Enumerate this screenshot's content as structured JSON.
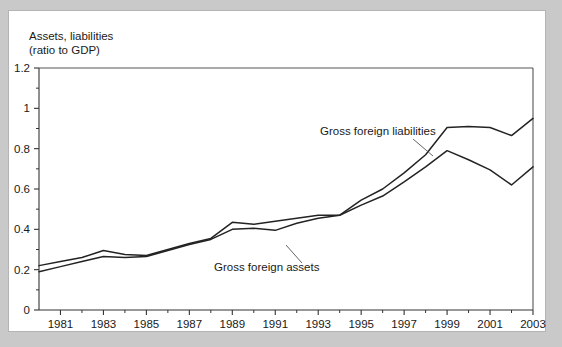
{
  "figure": {
    "axis_title_line1": "Assets, liabilities",
    "axis_title_line2": "(ratio to GDP)",
    "background_color": "#c9c9c9",
    "panel_color": "#ffffff",
    "line_color": "#232323"
  },
  "chart_data": {
    "type": "line",
    "title": "Assets, liabilities (ratio to GDP)",
    "xlabel": "",
    "ylabel": "Assets, liabilities (ratio to GDP)",
    "xlim": [
      1980,
      2003
    ],
    "ylim": [
      0,
      1.2
    ],
    "grid": false,
    "legend_position": "inline-annotations",
    "ytick_labels": [
      "0",
      "0.2",
      "0.4",
      "0.6",
      "0.8",
      "1",
      "1.2"
    ],
    "ytick_values": [
      0,
      0.2,
      0.4,
      0.6,
      0.8,
      1.0,
      1.2
    ],
    "yminor_values": [
      0.1,
      0.3,
      0.5,
      0.7,
      0.9,
      1.1
    ],
    "xtick_labels": [
      "1981",
      "1983",
      "1985",
      "1987",
      "1989",
      "1991",
      "1993",
      "1995",
      "1997",
      "1999",
      "2001",
      "2003"
    ],
    "xtick_values": [
      1981,
      1983,
      1985,
      1987,
      1989,
      1991,
      1993,
      1995,
      1997,
      1999,
      2001,
      2003
    ],
    "x": [
      1980,
      1981,
      1982,
      1983,
      1984,
      1985,
      1986,
      1987,
      1988,
      1989,
      1990,
      1991,
      1992,
      1993,
      1994,
      1995,
      1996,
      1997,
      1998,
      1999,
      2000,
      2001,
      2002,
      2003
    ],
    "series": [
      {
        "name": "Gross foreign liabilities",
        "values": [
          0.22,
          0.24,
          0.26,
          0.295,
          0.275,
          0.27,
          0.3,
          0.33,
          0.355,
          0.435,
          0.425,
          0.44,
          0.455,
          0.47,
          0.47,
          0.545,
          0.6,
          0.68,
          0.77,
          0.905,
          0.91,
          0.905,
          0.865,
          0.95
        ]
      },
      {
        "name": "Gross foreign assets",
        "values": [
          0.19,
          0.215,
          0.24,
          0.265,
          0.26,
          0.265,
          0.295,
          0.325,
          0.35,
          0.4,
          0.405,
          0.395,
          0.43,
          0.455,
          0.47,
          0.52,
          0.565,
          0.635,
          0.71,
          0.79,
          0.745,
          0.695,
          0.62,
          0.71
        ]
      }
    ],
    "annotations": [
      {
        "text": "Gross foreign liabilities",
        "series": "Gross foreign liabilities",
        "label_x": 311,
        "label_y": 124,
        "leader_from_x": 404,
        "leader_from_y": 128,
        "leader_to_x": 424,
        "leader_to_y": 145
      },
      {
        "text": "Gross foreign assets",
        "series": "Gross foreign assets",
        "label_x": 205,
        "label_y": 260,
        "leader_from_x": 293,
        "leader_from_y": 252,
        "leader_to_x": 277,
        "leader_to_y": 234
      }
    ]
  }
}
